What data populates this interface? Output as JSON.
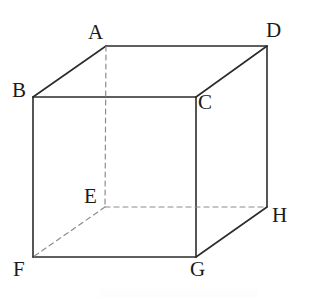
{
  "figure": {
    "name": "cube-diagram",
    "width": 310,
    "height": 302,
    "background_color": "#ffffff",
    "solid_line_color": "#2b2b2b",
    "dashed_line_color": "#8c8c8c",
    "label_color": "#1a1a1a",
    "solid_line_width": 1.6,
    "dashed_line_width": 1.2,
    "dash_pattern": "5 4"
  },
  "vertices": [
    {
      "id": "A",
      "label": "A",
      "x": 106,
      "y": 46,
      "label_x": 88,
      "label_y": 22,
      "hidden": false
    },
    {
      "id": "B",
      "label": "B",
      "x": 33,
      "y": 97,
      "label_x": 12,
      "label_y": 80,
      "hidden": false
    },
    {
      "id": "C",
      "label": "C",
      "x": 196,
      "y": 97,
      "label_x": 198,
      "label_y": 92,
      "hidden": false
    },
    {
      "id": "D",
      "label": "D",
      "x": 267,
      "y": 46,
      "label_x": 266,
      "label_y": 20,
      "hidden": false
    },
    {
      "id": "E",
      "label": "E",
      "x": 105,
      "y": 207,
      "label_x": 84,
      "label_y": 186,
      "hidden": true
    },
    {
      "id": "F",
      "label": "F",
      "x": 33,
      "y": 257,
      "label_x": 13,
      "label_y": 259,
      "hidden": false
    },
    {
      "id": "G",
      "label": "G",
      "x": 196,
      "y": 257,
      "label_x": 190,
      "label_y": 259,
      "hidden": false
    },
    {
      "id": "H",
      "label": "H",
      "x": 267,
      "y": 207,
      "label_x": 272,
      "label_y": 205,
      "hidden": false
    }
  ],
  "edges": [
    {
      "id": "edge-AB",
      "from": "A",
      "to": "B",
      "style": "solid"
    },
    {
      "id": "edge-AD",
      "from": "A",
      "to": "D",
      "style": "solid"
    },
    {
      "id": "edge-BC",
      "from": "B",
      "to": "C",
      "style": "solid"
    },
    {
      "id": "edge-CD",
      "from": "C",
      "to": "D",
      "style": "solid"
    },
    {
      "id": "edge-BF",
      "from": "B",
      "to": "F",
      "style": "solid"
    },
    {
      "id": "edge-CG",
      "from": "C",
      "to": "G",
      "style": "solid"
    },
    {
      "id": "edge-DH",
      "from": "D",
      "to": "H",
      "style": "solid"
    },
    {
      "id": "edge-FG",
      "from": "F",
      "to": "G",
      "style": "solid"
    },
    {
      "id": "edge-GH",
      "from": "G",
      "to": "H",
      "style": "solid"
    },
    {
      "id": "edge-AE",
      "from": "A",
      "to": "E",
      "style": "dashed"
    },
    {
      "id": "edge-EF",
      "from": "E",
      "to": "F",
      "style": "dashed"
    },
    {
      "id": "edge-EH",
      "from": "E",
      "to": "H",
      "style": "dashed"
    }
  ]
}
